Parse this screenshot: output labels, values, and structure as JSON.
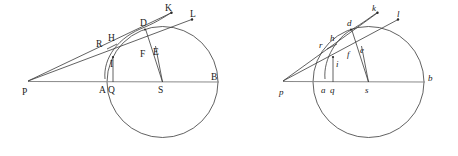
{
  "figure": {
    "background_color": "#ffffff",
    "stroke_color": "#3a3a3a",
    "axis_color": "#8a8a8a",
    "label_color": "#1a1a1a"
  },
  "diagrams": [
    {
      "id": "left-diagram",
      "label_style": "uppercase-roman",
      "apex": {
        "name": "P",
        "x": 28,
        "y": 81
      },
      "circle": {
        "cx": 162.5,
        "cy": 82,
        "r": 55.5
      },
      "points": [
        {
          "name": "P",
          "label": "P",
          "x": 28,
          "y": 81,
          "lx": 22,
          "ly": 95
        },
        {
          "name": "A",
          "label": "A",
          "x": 107,
          "y": 82,
          "lx": 99,
          "ly": 93
        },
        {
          "name": "Q",
          "label": "Q",
          "x": 113,
          "y": 82,
          "lx": 109,
          "ly": 93
        },
        {
          "name": "S",
          "label": "S",
          "x": 162.5,
          "y": 82,
          "lx": 158,
          "ly": 93
        },
        {
          "name": "B",
          "label": "B",
          "x": 218,
          "y": 82,
          "lx": 210,
          "ly": 80
        },
        {
          "name": "R",
          "label": "R",
          "x": 108,
          "y": 47,
          "lx": 98,
          "ly": 45
        },
        {
          "name": "H",
          "label": "H",
          "x": 115,
          "y": 44,
          "lx": 108,
          "ly": 40
        },
        {
          "name": "I",
          "label": "I",
          "x": 113,
          "y": 58,
          "lx": 110,
          "ly": 66
        },
        {
          "name": "D",
          "label": "D",
          "x": 145,
          "y": 29,
          "lx": 141,
          "ly": 27
        },
        {
          "name": "F",
          "label": "F",
          "x": 146,
          "y": 50,
          "lx": 142,
          "ly": 56
        },
        {
          "name": "E",
          "label": "E",
          "x": 155,
          "y": 48,
          "lx": 154,
          "ly": 54
        },
        {
          "name": "K",
          "label": "K",
          "x": 171,
          "y": 13,
          "lx": 166,
          "ly": 11
        },
        {
          "name": "L",
          "label": "L",
          "x": 192,
          "y": 19,
          "lx": 191,
          "ly": 17
        }
      ],
      "rays": [
        {
          "name": "ray-P-K",
          "from": "P",
          "to": "K"
        },
        {
          "name": "ray-P-L",
          "from": "P",
          "to": "L"
        },
        {
          "name": "axis-P-B",
          "from": "P",
          "to": "B"
        }
      ],
      "segments": [
        {
          "name": "chord-R-H",
          "from": "R",
          "to": "H"
        },
        {
          "name": "segment-Q-I",
          "from": "Q",
          "to": "I"
        },
        {
          "name": "segment-S-D",
          "from": "S",
          "to": "D"
        },
        {
          "name": "segment-S-E",
          "from": "S",
          "to": "E"
        },
        {
          "name": "arc-R-H-D-K",
          "type": "arc"
        }
      ]
    },
    {
      "id": "right-diagram",
      "label_style": "lowercase-italic",
      "apex": {
        "name": "p",
        "x": 283,
        "y": 81
      },
      "circle": {
        "cx": 368.5,
        "cy": 82,
        "r": 55.5
      },
      "points": [
        {
          "name": "p",
          "label": "p",
          "x": 283,
          "y": 81,
          "lx": 278,
          "ly": 95
        },
        {
          "name": "a",
          "label": "a",
          "x": 324,
          "y": 82,
          "lx": 321,
          "ly": 93
        },
        {
          "name": "q",
          "label": "q",
          "x": 333,
          "y": 82,
          "lx": 330,
          "ly": 93
        },
        {
          "name": "s",
          "label": "s",
          "x": 368.5,
          "y": 82,
          "lx": 365,
          "ly": 93
        },
        {
          "name": "b",
          "label": "b",
          "x": 424,
          "y": 82,
          "lx": 427,
          "ly": 81
        },
        {
          "name": "r",
          "label": "r",
          "x": 328,
          "y": 47,
          "lx": 320,
          "ly": 47
        },
        {
          "name": "h",
          "label": "h",
          "x": 335,
          "y": 43,
          "lx": 331,
          "ly": 40
        },
        {
          "name": "i",
          "label": "i",
          "x": 333,
          "y": 58,
          "lx": 335,
          "ly": 66
        },
        {
          "name": "d",
          "label": "d",
          "x": 351,
          "y": 29,
          "lx": 348,
          "ly": 27
        },
        {
          "name": "f",
          "label": "f",
          "x": 352,
          "y": 50,
          "lx": 348,
          "ly": 56
        },
        {
          "name": "e",
          "label": "e",
          "x": 361,
          "y": 48,
          "lx": 361,
          "ly": 52
        },
        {
          "name": "k",
          "label": "k",
          "x": 377,
          "y": 13,
          "lx": 373,
          "ly": 11
        },
        {
          "name": "l",
          "label": "l",
          "x": 398,
          "y": 19,
          "lx": 398,
          "ly": 17
        }
      ],
      "rays": [
        {
          "name": "ray-p-k",
          "from": "p",
          "to": "k"
        },
        {
          "name": "ray-p-l",
          "from": "p",
          "to": "l"
        },
        {
          "name": "axis-p-b",
          "from": "p",
          "to": "b"
        }
      ],
      "segments": [
        {
          "name": "chord-r-h",
          "from": "r",
          "to": "h"
        },
        {
          "name": "segment-q-i",
          "from": "q",
          "to": "i"
        },
        {
          "name": "segment-s-d",
          "from": "s",
          "to": "d"
        },
        {
          "name": "segment-s-e",
          "from": "s",
          "to": "e"
        },
        {
          "name": "arc-r-h-d-k",
          "type": "arc"
        }
      ]
    }
  ]
}
